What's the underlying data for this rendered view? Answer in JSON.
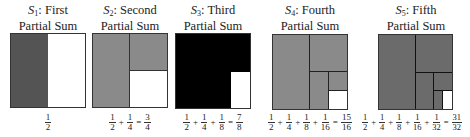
{
  "panels": [
    {
      "symbol": "S",
      "sub": "1",
      "name": ": First",
      "line2": "Partial Sum",
      "color": "#545454",
      "terms": [
        [
          "1",
          "2"
        ]
      ],
      "result": null
    },
    {
      "symbol": "S",
      "sub": "2",
      "name": ": Second",
      "line2": "Partial Sum",
      "color": "#8a8a8a",
      "terms": [
        [
          "1",
          "2"
        ],
        [
          "1",
          "4"
        ]
      ],
      "result": [
        "3",
        "4"
      ]
    },
    {
      "symbol": "S",
      "sub": "3",
      "name": ": Third",
      "line2": "Partial Sum",
      "color": "#000000",
      "terms": [
        [
          "1",
          "2"
        ],
        [
          "1",
          "4"
        ],
        [
          "1",
          "8"
        ]
      ],
      "result": [
        "7",
        "8"
      ]
    },
    {
      "symbol": "S",
      "sub": "4",
      "name": ": Fourth",
      "line2": "Partial Sum",
      "color": "#8a8a8a",
      "terms": [
        [
          "1",
          "2"
        ],
        [
          "1",
          "4"
        ],
        [
          "1",
          "8"
        ],
        [
          "1",
          "16"
        ]
      ],
      "result": [
        "15",
        "16"
      ]
    },
    {
      "symbol": "S",
      "sub": "5",
      "name": ": Fifth",
      "line2": "Partial Sum",
      "color": "#6b6b6b",
      "terms": [
        [
          "1",
          "2"
        ],
        [
          "1",
          "4"
        ],
        [
          "1",
          "8"
        ],
        [
          "1",
          "16"
        ],
        [
          "1",
          "32"
        ]
      ],
      "result": [
        "31",
        "32"
      ]
    }
  ],
  "labels": {
    "p1_title": "S",
    "p1_sub": "1",
    "p1_name": ": First",
    "p1_line2": "Partial Sum",
    "p2_title": "S",
    "p2_sub": "2",
    "p2_name": ": Second",
    "p2_line2": "Partial Sum",
    "p3_title": "S",
    "p3_sub": "3",
    "p3_name": ": Third",
    "p3_line2": "Partial Sum",
    "p4_title": "S",
    "p4_sub": "4",
    "p4_name": ": Fourth",
    "p4_line2": "Partial Sum",
    "p5_title": "S",
    "p5_sub": "5",
    "p5_name": ": Fifth",
    "p5_line2": "Partial Sum",
    "one": "1",
    "two": "2",
    "three": "3",
    "four": "4",
    "seven": "7",
    "eight": "8",
    "fifteen": "15",
    "sixteen": "16",
    "thirtyone": "31",
    "thirtytwo": "32",
    "plus": "+",
    "equals": "="
  }
}
